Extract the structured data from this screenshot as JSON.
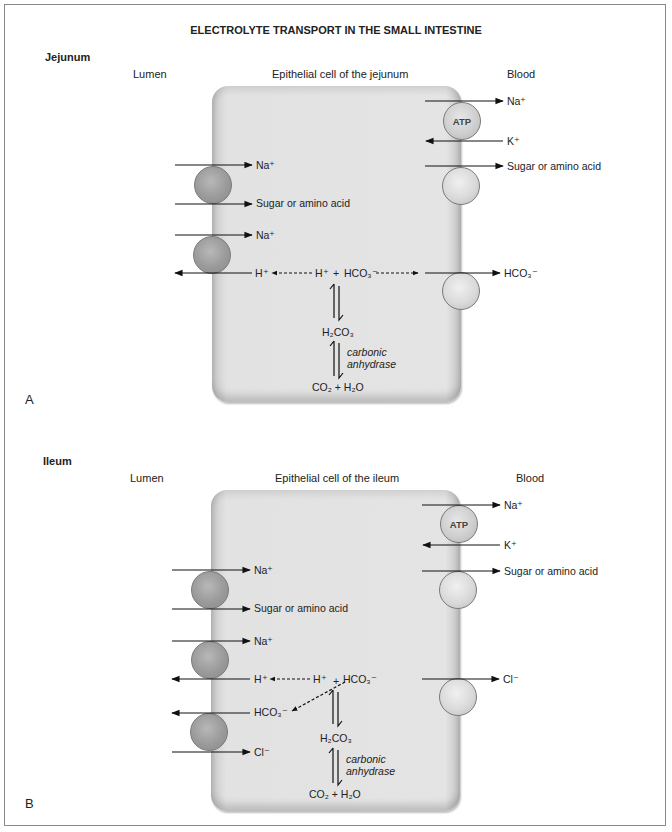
{
  "title": "ELECTROLYTE TRANSPORT IN THE SMALL INTESTINE",
  "panels": [
    {
      "letter": "A",
      "section": "Jejunum",
      "columns": {
        "lumen": "Lumen",
        "cell": "Epithelial cell of the jejunum",
        "blood": "Blood"
      },
      "blood_side": {
        "atp_label": "ATP",
        "na_out": "Na⁺",
        "k_in": "K⁺",
        "sugar": "Sugar or amino acid",
        "exchanger": "HCO₃⁻"
      },
      "lumen_side": {
        "na1": "Na⁺",
        "sugar": "Sugar or amino acid",
        "na2": "Na⁺",
        "h_out": "H⁺"
      },
      "reaction": {
        "top_h": "H⁺",
        "plus": "+",
        "top_hco3": "HCO₃⁻",
        "middle": "H₂CO₃",
        "enzyme_line1": "carbonic",
        "enzyme_line2": "anhydrase",
        "bottom": "CO₂ + H₂O"
      }
    },
    {
      "letter": "B",
      "section": "Ileum",
      "columns": {
        "lumen": "Lumen",
        "cell": "Epithelial cell of the ileum",
        "blood": "Blood"
      },
      "blood_side": {
        "atp_label": "ATP",
        "na_out": "Na⁺",
        "k_in": "K⁺",
        "sugar": "Sugar or amino acid",
        "exchanger": "Cl⁻"
      },
      "lumen_side": {
        "na1": "Na⁺",
        "sugar": "Sugar or amino acid",
        "na2": "Na⁺",
        "h_out": "H⁺",
        "hco3_out": "HCO₃⁻",
        "cl_in": "Cl⁻"
      },
      "reaction": {
        "top_h": "H⁺",
        "plus": "+",
        "top_hco3": "HCO₃⁻",
        "middle": "H₂CO₃",
        "enzyme_line1": "carbonic",
        "enzyme_line2": "anhydrase",
        "bottom": "CO₂ + H₂O"
      }
    }
  ],
  "colors": {
    "cell_fill": "#e2e2e2",
    "arrow": "#111111",
    "frame": "#8a8a8a"
  }
}
